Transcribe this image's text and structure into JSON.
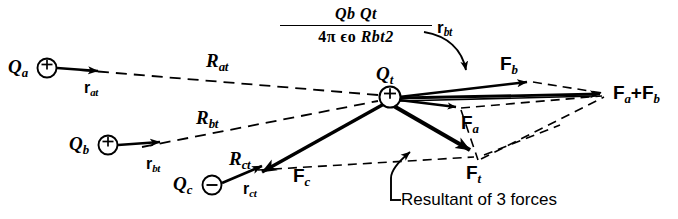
{
  "figure": {
    "background": "#ffffff",
    "ink": "#000000",
    "width": 678,
    "height": 219
  },
  "charges": [
    {
      "id": "Qa",
      "label": "Q",
      "sub": "a",
      "sign": "+",
      "x": 47,
      "y": 68,
      "r": 9
    },
    {
      "id": "Qb",
      "label": "Q",
      "sub": "b",
      "sign": "+",
      "x": 108,
      "y": 145,
      "r": 9
    },
    {
      "id": "Qc",
      "label": "Q",
      "sub": "c",
      "sign": "−",
      "x": 212,
      "y": 186,
      "r": 9
    },
    {
      "id": "Qt",
      "label": "Q",
      "sub": "t",
      "sign": "+",
      "x": 390,
      "y": 97,
      "r": 10
    }
  ],
  "labels": {
    "Qa": {
      "base": "Q",
      "sub": "a"
    },
    "Qb": {
      "base": "Q",
      "sub": "b"
    },
    "Qc": {
      "base": "Q",
      "sub": "c"
    },
    "Qt": {
      "base": "Q",
      "sub": "t"
    },
    "r_at": {
      "base": "r",
      "sub": "at"
    },
    "r_bt": {
      "base": "r",
      "sub": "bt"
    },
    "r_ct": {
      "base": "r",
      "sub": "ct"
    },
    "r_bt_formula": {
      "base": "r",
      "sub": "bt"
    },
    "R_at": {
      "base": "R",
      "sub": "at"
    },
    "R_bt": {
      "base": "R",
      "sub": "bt"
    },
    "R_ct": {
      "base": "R",
      "sub": "ct"
    },
    "F_a": {
      "base": "F",
      "sub": "a"
    },
    "F_b": {
      "base": "F",
      "sub": "b"
    },
    "F_c": {
      "base": "F",
      "sub": "c"
    },
    "F_t": {
      "base": "F",
      "sub": "t"
    },
    "F_sum": {
      "text": "F",
      "sub1": "a",
      "plus": "+",
      "text2": "F",
      "sub2": "b"
    }
  },
  "formula": {
    "numerator": {
      "q1": "Q",
      "q1sub": "b",
      "q2": "Q",
      "q2sub": "t"
    },
    "denominator": {
      "four": "4",
      "pi": "π",
      "eps": "ϵ",
      "epssub": "o",
      "R": "R",
      "Rsub": "bt",
      "Rsup": "2"
    },
    "vector": {
      "base": "r",
      "sub": "bt"
    }
  },
  "caption": {
    "resultant": "Resultant of 3 forces"
  },
  "signs": {
    "positive": "+",
    "negative": "−"
  }
}
